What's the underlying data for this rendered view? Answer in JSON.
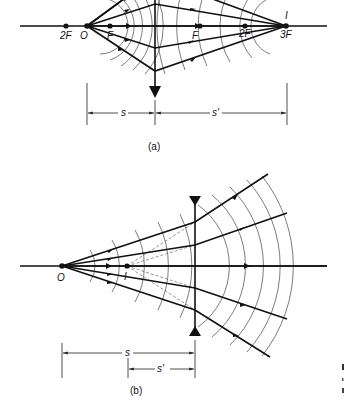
{
  "figure_a": {
    "caption": "(a)",
    "labels": {
      "two_f_left": "2F",
      "object": "O",
      "f_left": "F",
      "f_right": "F",
      "two_f_right": "2F",
      "image": "I",
      "three_f": "3F",
      "s": "s",
      "s_prime": "s'"
    },
    "lens_type": "converging"
  },
  "figure_b": {
    "caption": "(b)",
    "labels": {
      "object": "O",
      "image": "I",
      "s": "s",
      "s_prime": "s'"
    },
    "lens_type": "diverging"
  },
  "colors": {
    "ink": "#111111",
    "wavefront": "#444444",
    "background": "#ffffff"
  }
}
